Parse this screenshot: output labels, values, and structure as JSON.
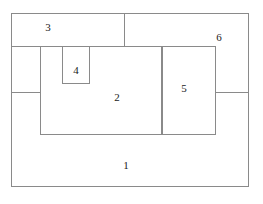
{
  "figure": {
    "type": "nested-rectangle-partition-diagram",
    "background_color": "#ffffff",
    "line_color": "#8a8a8a",
    "label_color": "#1a1a1a",
    "regions": [
      {
        "id": "1",
        "label": "1",
        "role": "outermost-region"
      },
      {
        "id": "2",
        "label": "2",
        "role": "central-region"
      },
      {
        "id": "3",
        "label": "3",
        "role": "upper-left-region"
      },
      {
        "id": "4",
        "label": "4",
        "role": "small-inner-region"
      },
      {
        "id": "5",
        "label": "5",
        "role": "right-inner-region"
      },
      {
        "id": "6",
        "label": "6",
        "role": "upper-right-region"
      }
    ]
  }
}
